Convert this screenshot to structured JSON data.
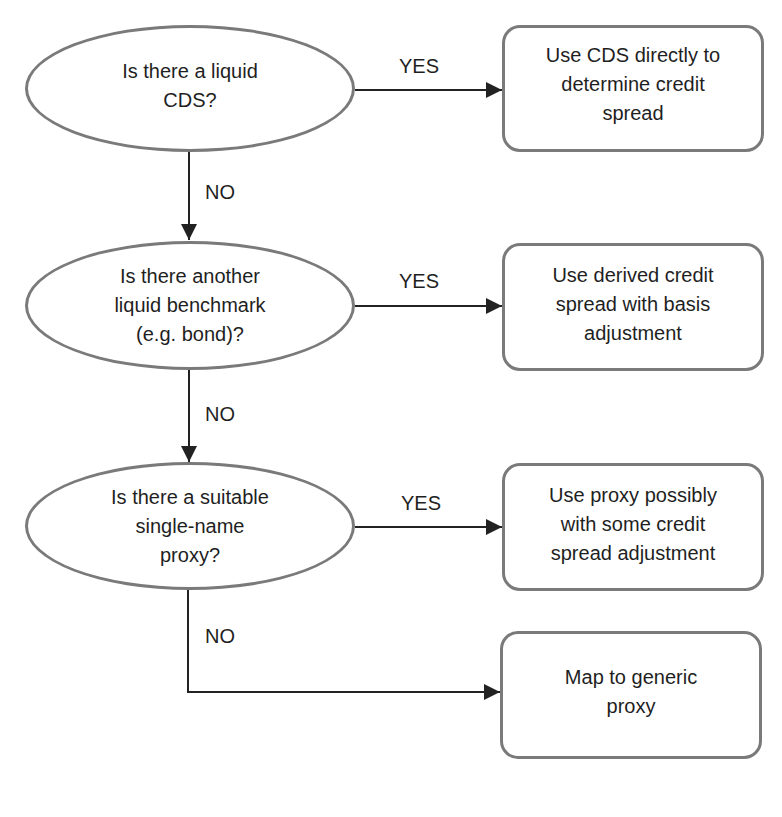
{
  "diagram": {
    "type": "flowchart",
    "decisions": [
      {
        "id": "d1",
        "text": "Is there a liquid\nCDS?"
      },
      {
        "id": "d2",
        "text": "Is there another\nliquid benchmark\n(e.g. bond)?"
      },
      {
        "id": "d3",
        "text": "Is there a suitable\nsingle-name\nproxy?"
      }
    ],
    "actions": [
      {
        "id": "a1",
        "text": "Use CDS directly to\ndetermine credit\nspread"
      },
      {
        "id": "a2",
        "text": "Use derived credit\nspread with basis\nadjustment"
      },
      {
        "id": "a3",
        "text": "Use proxy possibly\nwith some credit\nspread adjustment"
      },
      {
        "id": "a4",
        "text": "Map to generic\nproxy"
      }
    ],
    "edges": [
      {
        "from": "d1",
        "to": "a1",
        "label": "YES"
      },
      {
        "from": "d1",
        "to": "d2",
        "label": "NO"
      },
      {
        "from": "d2",
        "to": "a2",
        "label": "YES"
      },
      {
        "from": "d2",
        "to": "d3",
        "label": "NO"
      },
      {
        "from": "d3",
        "to": "a3",
        "label": "YES"
      },
      {
        "from": "d3",
        "to": "a4",
        "label": "NO"
      }
    ]
  },
  "colors": {
    "shape_border": "#7a7a7a",
    "arrow": "#222222",
    "text": "#1f1f1f",
    "background": "#ffffff"
  }
}
